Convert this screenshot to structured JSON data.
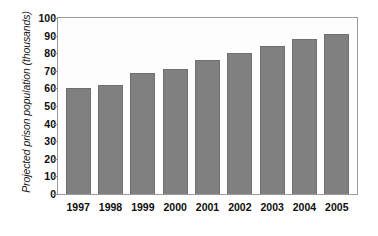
{
  "chart_data": {
    "type": "bar",
    "title": "",
    "subtitle": "",
    "xlabel": "",
    "ylabel": "Projected prison population (thousands)",
    "categories": [
      "1997",
      "1998",
      "1999",
      "2000",
      "2001",
      "2002",
      "2003",
      "2004",
      "2005"
    ],
    "values": [
      60,
      62,
      69,
      71,
      76,
      80,
      84,
      88,
      91
    ],
    "series": [
      {
        "name": "Projected prison population",
        "values": [
          60,
          62,
          69,
          71,
          76,
          80,
          84,
          88,
          91
        ]
      }
    ],
    "ylim": [
      0,
      100
    ],
    "yticks": [
      0,
      10,
      20,
      30,
      40,
      50,
      60,
      70,
      80,
      90,
      100
    ],
    "ytick_labels": [
      "0",
      "10",
      "20",
      "30",
      "40",
      "50",
      "60",
      "70",
      "80",
      "90",
      "100"
    ],
    "xtick_labels": [
      "1997",
      "1998",
      "1999",
      "2000",
      "2001",
      "2002",
      "2003",
      "2004",
      "2005"
    ],
    "grid": false,
    "legend": false,
    "legend_position": "none",
    "bar_color": "#808080",
    "bar_edge_color": "#6f6f6f",
    "frame_color": "#9a9a9a",
    "plot_background": "#fdfdfd",
    "figure_background": "#ffffff",
    "text_color": "#0d0d0d"
  }
}
